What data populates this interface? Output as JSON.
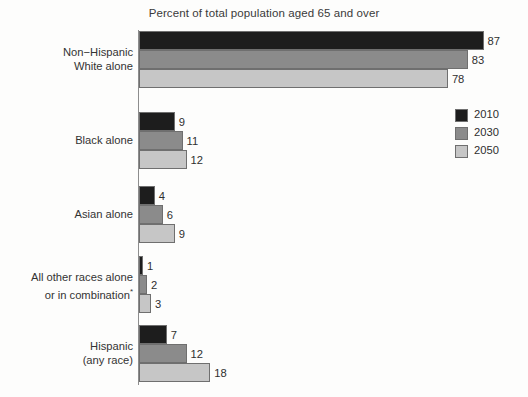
{
  "chart_data": {
    "type": "bar",
    "orientation": "horizontal",
    "title": "Percent of total population aged 65 and over",
    "xlabel": "",
    "ylabel": "",
    "xlim": [
      0,
      92
    ],
    "grid": false,
    "legend_position": "right",
    "categories": [
      "Non−Hispanic\nWhite alone",
      "Black alone",
      "Asian alone",
      "All other races alone\nor in combination",
      "Hispanic\n(any race)"
    ],
    "series": [
      {
        "name": "2010",
        "color": "#1d1d1d",
        "values": [
          87,
          9,
          4,
          1,
          7
        ]
      },
      {
        "name": "2030",
        "color": "#8b8b8b",
        "values": [
          83,
          11,
          6,
          2,
          12
        ]
      },
      {
        "name": "2050",
        "color": "#c6c6c6",
        "values": [
          78,
          12,
          9,
          3,
          18
        ]
      }
    ]
  },
  "groups": [
    {
      "label_line1": "Non−Hispanic",
      "label_line2": "White alone",
      "has_footnote_marker": false,
      "bars": [
        {
          "series": "2010",
          "value": 87,
          "value_text": "87",
          "color": "#1d1d1d"
        },
        {
          "series": "2030",
          "value": 83,
          "value_text": "83",
          "color": "#8b8b8b"
        },
        {
          "series": "2050",
          "value": 78,
          "value_text": "78",
          "color": "#c6c6c6"
        }
      ]
    },
    {
      "label_line1": "Black alone",
      "label_line2": "",
      "has_footnote_marker": false,
      "bars": [
        {
          "series": "2010",
          "value": 9,
          "value_text": "9",
          "color": "#1d1d1d"
        },
        {
          "series": "2030",
          "value": 11,
          "value_text": "11",
          "color": "#8b8b8b"
        },
        {
          "series": "2050",
          "value": 12,
          "value_text": "12",
          "color": "#c6c6c6"
        }
      ]
    },
    {
      "label_line1": "Asian alone",
      "label_line2": "",
      "has_footnote_marker": false,
      "bars": [
        {
          "series": "2010",
          "value": 4,
          "value_text": "4",
          "color": "#1d1d1d"
        },
        {
          "series": "2030",
          "value": 6,
          "value_text": "6",
          "color": "#8b8b8b"
        },
        {
          "series": "2050",
          "value": 9,
          "value_text": "9",
          "color": "#c6c6c6"
        }
      ]
    },
    {
      "label_line1": "All other races alone",
      "label_line2": "or in combination",
      "has_footnote_marker": true,
      "footnote_marker": "*",
      "bars": [
        {
          "series": "2010",
          "value": 1,
          "value_text": "1",
          "color": "#1d1d1d"
        },
        {
          "series": "2030",
          "value": 2,
          "value_text": "2",
          "color": "#8b8b8b"
        },
        {
          "series": "2050",
          "value": 3,
          "value_text": "3",
          "color": "#c6c6c6"
        }
      ]
    },
    {
      "label_line1": "Hispanic",
      "label_line2": "(any race)",
      "has_footnote_marker": false,
      "bars": [
        {
          "series": "2010",
          "value": 7,
          "value_text": "7",
          "color": "#1d1d1d"
        },
        {
          "series": "2030",
          "value": 12,
          "value_text": "12",
          "color": "#8b8b8b"
        },
        {
          "series": "2050",
          "value": 18,
          "value_text": "18",
          "color": "#c6c6c6"
        }
      ]
    }
  ],
  "legend": {
    "entries": [
      {
        "label": "2010",
        "color": "#1d1d1d"
      },
      {
        "label": "2030",
        "color": "#8b8b8b"
      },
      {
        "label": "2050",
        "color": "#c6c6c6"
      }
    ]
  }
}
